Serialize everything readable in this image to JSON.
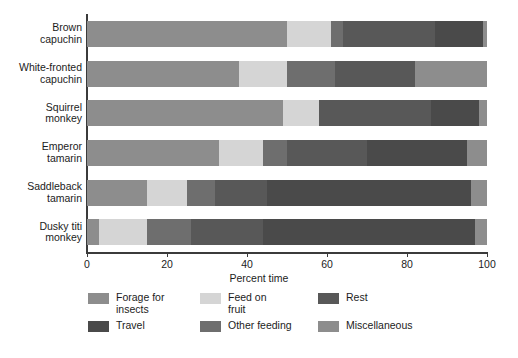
{
  "chart_data": {
    "type": "bar",
    "orientation": "horizontal",
    "stacked": true,
    "title": "",
    "xlabel": "Percent time",
    "ylabel": "",
    "xlim": [
      0,
      100
    ],
    "xticks": [
      0,
      20,
      40,
      60,
      80,
      100
    ],
    "grid": false,
    "legend_position": "bottom",
    "categories": [
      "Brown\ncapuchin",
      "White-fronted\ncapuchin",
      "Squirrel\nmonkey",
      "Emperor\ntamarin",
      "Saddleback\ntamarin",
      "Dusky titi\nmonkey"
    ],
    "series": [
      {
        "name": "Forage for\ninsects",
        "legend_label": "Forage for insects",
        "color": "#8d8d8d",
        "values": [
          50,
          38,
          49,
          33,
          15,
          3
        ]
      },
      {
        "name": "Feed on\nfruit",
        "legend_label": "Feed on fruit",
        "color": "#d5d5d5",
        "values": [
          11,
          12,
          9,
          11,
          10,
          12
        ]
      },
      {
        "name": "Other feeding",
        "legend_label": "Other feeding",
        "color": "#6e6e6e",
        "values": [
          3,
          12,
          0,
          6,
          7,
          11
        ]
      },
      {
        "name": "Rest",
        "legend_label": "Rest",
        "color": "#585858",
        "values": [
          23,
          20,
          28,
          20,
          13,
          18
        ]
      },
      {
        "name": "Travel",
        "legend_label": "Travel",
        "color": "#4a4a4a",
        "values": [
          12,
          0,
          12,
          25,
          51,
          53
        ]
      },
      {
        "name": "Miscellaneous",
        "legend_label": "Miscellaneous",
        "color": "#8d8d8d",
        "values": [
          1,
          18,
          2,
          5,
          4,
          3
        ]
      }
    ]
  },
  "legend": {
    "items": [
      {
        "label": "Forage for\ninsects",
        "color": "#8d8d8d",
        "icon": "legend-swatch"
      },
      {
        "label": "Feed on\nfruit",
        "color": "#d5d5d5",
        "icon": "legend-swatch"
      },
      {
        "label": "Rest",
        "color": "#585858",
        "icon": "legend-swatch"
      },
      {
        "label": "Travel",
        "color": "#4a4a4a",
        "icon": "legend-swatch"
      },
      {
        "label": "Other feeding",
        "color": "#6e6e6e",
        "icon": "legend-swatch"
      },
      {
        "label": "Miscellaneous",
        "color": "#8d8d8d",
        "icon": "legend-swatch"
      }
    ]
  },
  "axis": {
    "x_title": "Percent time",
    "x_tick_labels": [
      "0",
      "20",
      "40",
      "60",
      "80",
      "100"
    ]
  },
  "colors": {
    "axis_line": "#3b3b3b",
    "text": "#1c1c1c",
    "background": "#ffffff"
  }
}
